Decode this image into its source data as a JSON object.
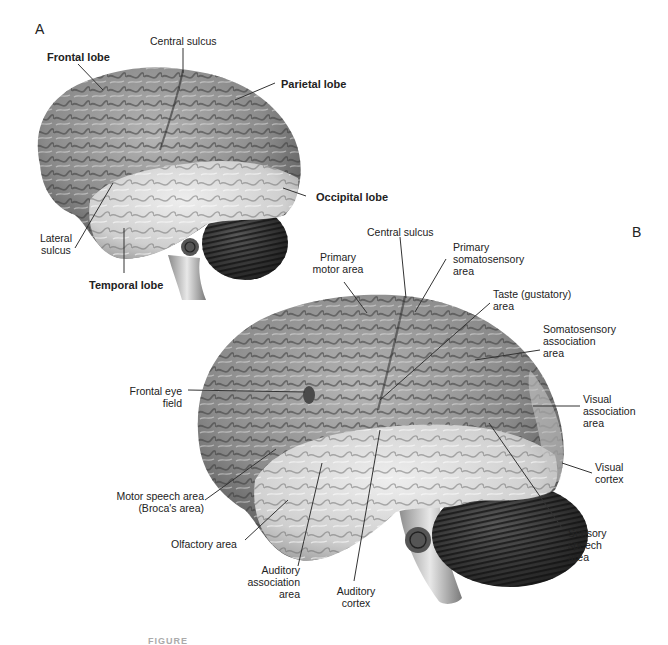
{
  "figure": {
    "panels": [
      {
        "id": "A",
        "label": "A",
        "labels": {
          "frontal_lobe": "Frontal lobe",
          "central_sulcus": "Central sulcus",
          "parietal_lobe": "Parietal lobe",
          "occipital_lobe": "Occipital lobe",
          "lateral_sulcus_1": "Lateral",
          "lateral_sulcus_2": "sulcus",
          "temporal_lobe": "Temporal lobe"
        }
      },
      {
        "id": "B",
        "label": "B",
        "labels": {
          "central_sulcus": "Central sulcus",
          "primary_motor_1": "Primary",
          "primary_motor_2": "motor area",
          "primary_somatosensory_1": "Primary",
          "primary_somatosensory_2": "somatosensory",
          "primary_somatosensory_3": "area",
          "taste_1": "Taste (gustatory)",
          "taste_2": "area",
          "somatosensory_assoc_1": "Somatosensory",
          "somatosensory_assoc_2": "association",
          "somatosensory_assoc_3": "area",
          "frontal_eye_1": "Frontal eye",
          "frontal_eye_2": "field",
          "visual_assoc_1": "Visual",
          "visual_assoc_2": "association",
          "visual_assoc_3": "area",
          "visual_cortex_1": "Visual",
          "visual_cortex_2": "cortex",
          "motor_speech_1": "Motor speech area",
          "motor_speech_2": "(Broca's area)",
          "olfactory": "Olfactory area",
          "sensory_speech_1": "Sensory",
          "sensory_speech_2": "speech",
          "sensory_speech_3": "area",
          "auditory_assoc_1": "Auditory",
          "auditory_assoc_2": "association",
          "auditory_assoc_3": "area",
          "auditory_cortex_1": "Auditory",
          "auditory_cortex_2": "cortex"
        }
      }
    ],
    "caption": "FIGURE"
  },
  "colors": {
    "background": "#ffffff",
    "text": "#222222",
    "cortex_dark": "#6e6e6e",
    "cortex_mid": "#9a9a9a",
    "temporal_light": "#d4d4d4",
    "cerebellum": "#3a3a3a",
    "leader_line": "#333333"
  }
}
